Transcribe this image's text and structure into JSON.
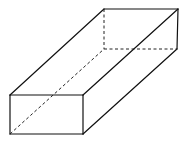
{
  "diagram": {
    "type": "cuboid-wireframe",
    "colors": {
      "background": "#ffffff",
      "line": "#111111"
    },
    "vertices": {
      "front_top_left": [
        10,
        95
      ],
      "front_top_right": [
        83,
        95
      ],
      "front_bottom_left": [
        10,
        134
      ],
      "front_bottom_right": [
        83,
        134
      ],
      "back_top_left": [
        104,
        9
      ],
      "back_top_right": [
        178,
        9
      ],
      "back_bottom_left": [
        104,
        49
      ],
      "back_bottom_right": [
        177,
        49
      ]
    },
    "visible_edges": [
      [
        "front_top_left",
        "front_top_right"
      ],
      [
        "front_top_right",
        "front_bottom_right"
      ],
      [
        "front_bottom_right",
        "front_bottom_left"
      ],
      [
        "front_bottom_left",
        "front_top_left"
      ],
      [
        "front_top_left",
        "back_top_left"
      ],
      [
        "front_top_right",
        "back_top_right"
      ],
      [
        "front_bottom_right",
        "back_bottom_right"
      ],
      [
        "back_top_left",
        "back_top_right"
      ],
      [
        "back_top_right",
        "back_bottom_right"
      ]
    ],
    "hidden_edges": [
      [
        "back_top_left",
        "back_bottom_left"
      ],
      [
        "back_bottom_left",
        "back_bottom_right"
      ],
      [
        "front_bottom_left",
        "back_bottom_left"
      ]
    ]
  }
}
